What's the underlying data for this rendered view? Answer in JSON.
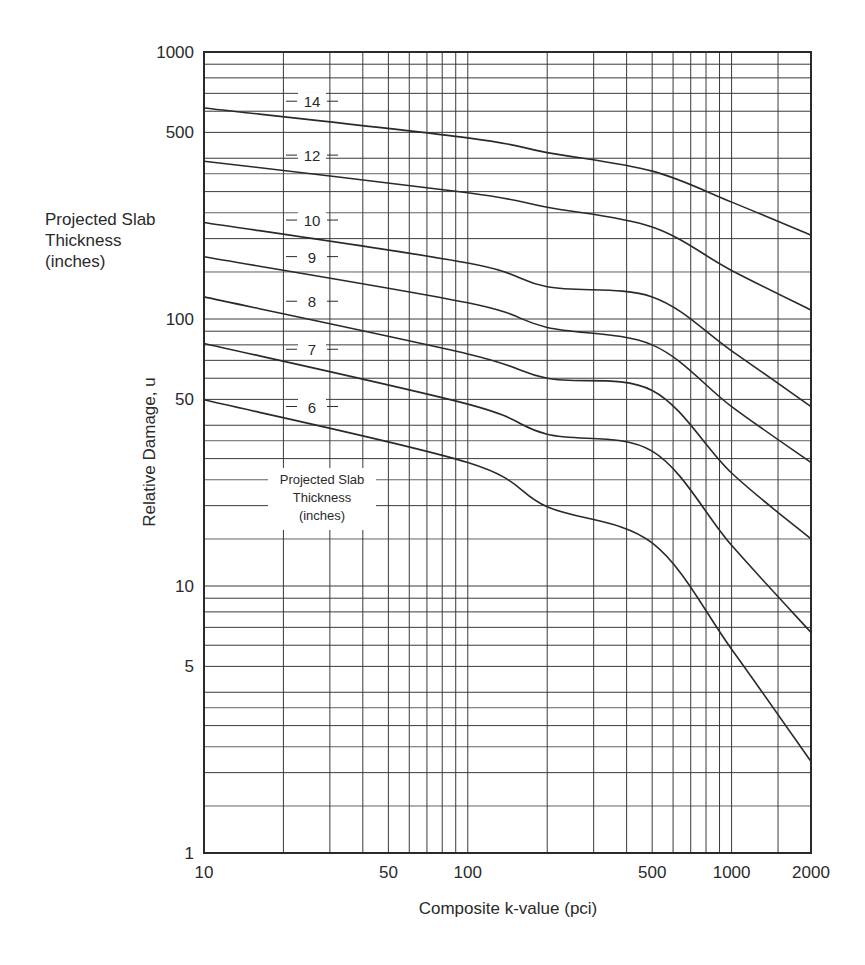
{
  "chart_data": {
    "type": "line",
    "title": "",
    "xlabel": "Composite k-value (pci)",
    "ylabel": "Relative Damage, u",
    "xscale": "log",
    "yscale": "log",
    "xlim": [
      10,
      2000
    ],
    "ylim": [
      1,
      1000
    ],
    "grid": true,
    "x_tick_labels": [
      "10",
      "50",
      "100",
      "500",
      "1000",
      "2000"
    ],
    "x_ticks": [
      10,
      50,
      100,
      500,
      1000,
      2000
    ],
    "y_tick_labels": [
      "1",
      "5",
      "10",
      "50",
      "100",
      "500",
      "1000"
    ],
    "y_ticks": [
      1,
      5,
      10,
      50,
      100,
      500,
      1000
    ],
    "legend_title": "Projected Slab Thickness (inches)",
    "x": [
      10,
      100,
      200,
      500,
      1000,
      2000
    ],
    "series": [
      {
        "name": "14",
        "values": [
          617,
          477,
          420,
          358,
          274,
          206
        ]
      },
      {
        "name": "12",
        "values": [
          390,
          297,
          262,
          221,
          152,
          108
        ]
      },
      {
        "name": "10",
        "values": [
          230,
          162,
          132,
          121,
          76,
          47
        ]
      },
      {
        "name": "9",
        "values": [
          171,
          115,
          93,
          80,
          47,
          29
        ]
      },
      {
        "name": "8",
        "values": [
          121,
          74,
          60,
          54,
          26.5,
          15
        ]
      },
      {
        "name": "7",
        "values": [
          81,
          48,
          37,
          32,
          14.2,
          6.7
        ]
      },
      {
        "name": "6",
        "values": [
          49.8,
          29,
          19.8,
          14.5,
          5.8,
          2.2
        ]
      }
    ]
  },
  "labels": {
    "side_note_line1": "Projected Slab",
    "side_note_line2": "Thickness",
    "side_note_line3": "(inches)",
    "inset_line1": "Projected Slab",
    "inset_line2": "Thickness",
    "inset_line3": "(inches)"
  },
  "colors": {
    "ink": "#2a2a2a",
    "grid": "#3a3a3a",
    "background": "#ffffff"
  }
}
